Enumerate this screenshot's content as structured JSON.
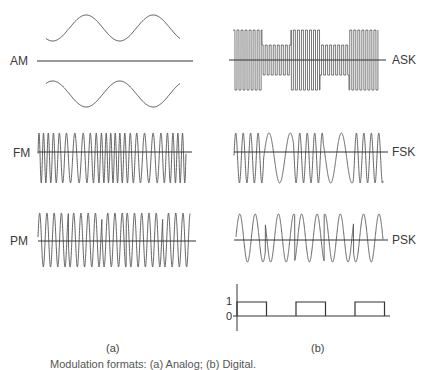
{
  "figure": {
    "panels": {
      "a": {
        "label": "(a)",
        "signals": [
          {
            "name": "AM",
            "label": "AM"
          },
          {
            "name": "FM",
            "label": "FM"
          },
          {
            "name": "PM",
            "label": "PM"
          }
        ]
      },
      "b": {
        "label": "(b)",
        "signals": [
          {
            "name": "ASK",
            "label": "ASK"
          },
          {
            "name": "FSK",
            "label": "FSK"
          },
          {
            "name": "PSK",
            "label": "PSK"
          }
        ],
        "digital_signal": {
          "y_ticks": [
            "1",
            "0"
          ],
          "bits": [
            1,
            0,
            1,
            0,
            1
          ]
        }
      }
    },
    "caption": "Modulation formats: (a) Analog; (b) Digital.",
    "colors": {
      "line": "#555555",
      "axis": "#333333",
      "background": "#ffffff"
    }
  }
}
